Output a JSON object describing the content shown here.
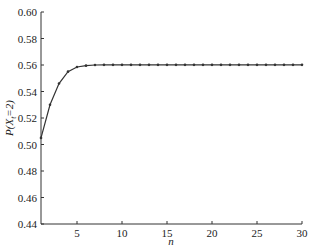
{
  "chart_data": {
    "type": "line",
    "title": "",
    "xlabel": "n",
    "ylabel": "P(X_t=2)",
    "ylabel_parts": {
      "main": "P(X",
      "sub": "t",
      "rest": "=2)"
    },
    "xlim": [
      1,
      30
    ],
    "ylim": [
      0.44,
      0.6
    ],
    "grid": false,
    "legend": null,
    "x_ticks": [
      5,
      10,
      15,
      20,
      25,
      30
    ],
    "x_tick_labels": [
      "5",
      "10",
      "15",
      "20",
      "25",
      "30"
    ],
    "y_ticks": [
      0.44,
      0.46,
      0.48,
      0.5,
      0.52,
      0.54,
      0.56,
      0.58,
      0.6
    ],
    "y_tick_labels": [
      "0.44",
      "0.46",
      "0.48",
      "0.50",
      "0.52",
      "0.54",
      "0.56",
      "0.58",
      "0.60"
    ],
    "series": [
      {
        "name": "P(X_t=2)",
        "marker": "dot",
        "color": "#333333",
        "x": [
          1,
          2,
          3,
          4,
          5,
          6,
          7,
          8,
          9,
          10,
          11,
          12,
          13,
          14,
          15,
          16,
          17,
          18,
          19,
          20,
          21,
          22,
          23,
          24,
          25,
          26,
          27,
          28,
          29,
          30
        ],
        "values": [
          0.505,
          0.53,
          0.546,
          0.555,
          0.5585,
          0.5595,
          0.56,
          0.5601,
          0.5601,
          0.5601,
          0.5601,
          0.5601,
          0.5601,
          0.5601,
          0.5601,
          0.5601,
          0.5601,
          0.5601,
          0.5601,
          0.5601,
          0.5601,
          0.5601,
          0.5601,
          0.5601,
          0.5601,
          0.5601,
          0.5601,
          0.5601,
          0.5601,
          0.5601
        ]
      }
    ]
  }
}
